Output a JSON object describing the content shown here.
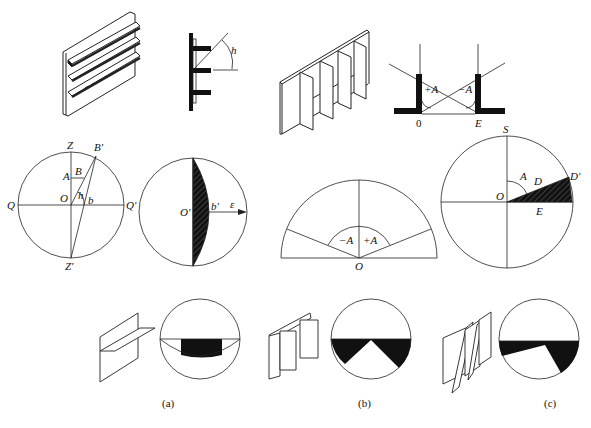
{
  "figure": {
    "panels": [
      {
        "id": "a",
        "caption": "(a)",
        "top_illustration": "horizontal-louver-shading",
        "section_labels": {
          "angle": "h"
        },
        "chart_labels": {
          "zenith": "Z",
          "nadir": "Z'",
          "west": "Q",
          "east": "Q'",
          "center": "O",
          "A": "A",
          "B": "B",
          "B_prime": "B'",
          "b": "b",
          "angle_h": "h"
        },
        "mask_labels": {
          "center": "O'",
          "b_prime": "b'",
          "epsilon": "ε"
        }
      },
      {
        "id": "b",
        "caption": "(b)",
        "top_illustration": "vertical-fin-shading",
        "section_labels": {
          "plus_angle": "+A",
          "minus_angle": "−A",
          "origin": "0",
          "end": "E"
        },
        "chart_labels": {
          "center": "O",
          "minus_angle": "−A",
          "plus_angle": "+A"
        }
      },
      {
        "id": "c",
        "caption": "(c)",
        "top_illustration": "oblique-fin-shading",
        "chart_labels": {
          "south": "S",
          "center": "O",
          "angle": "A",
          "D": "D",
          "D_prime": "D'",
          "E": "E"
        }
      }
    ]
  },
  "colors": {
    "line": "#222222",
    "fill": "#111111",
    "background": "#ffffff"
  }
}
